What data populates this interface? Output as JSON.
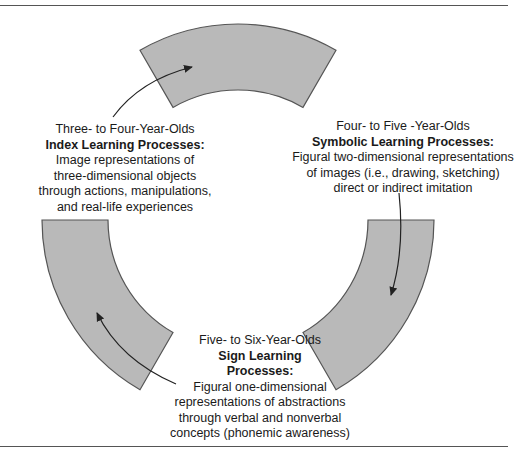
{
  "diagram": {
    "fill_color": "#b9b9b9",
    "stroke_color": "#555555",
    "arrow_color": "#222222",
    "center": [
      238,
      220
    ],
    "outer_radius": 196,
    "inner_radius": 130,
    "segments": [
      {
        "name": "top",
        "start_deg": -120,
        "end_deg": -60
      },
      {
        "name": "right",
        "start_deg": 0,
        "end_deg": 60
      },
      {
        "name": "left",
        "start_deg": 120,
        "end_deg": 180
      }
    ]
  },
  "stages": {
    "index": {
      "age": "Three- to Four-Year-Olds",
      "title": "Index Learning Processes:",
      "desc_lines": [
        "Image representations of",
        "three-dimensional objects",
        "through actions, manipulations,",
        "and real-life experiences"
      ]
    },
    "symbolic": {
      "age": "Four- to Five -Year-Olds",
      "title": "Symbolic Learning Processes:",
      "desc_lines": [
        "Figural two-dimensional representations",
        "of images (i.e., drawing, sketching)",
        "direct or indirect imitation"
      ]
    },
    "sign": {
      "age": "Five- to Six-Year-Olds",
      "title_lines": [
        "Sign Learning",
        "Processes:"
      ],
      "desc_lines": [
        "Figural one-dimensional",
        "representations of abstractions",
        "through verbal and nonverbal",
        "concepts (phonemic awareness)"
      ]
    }
  }
}
